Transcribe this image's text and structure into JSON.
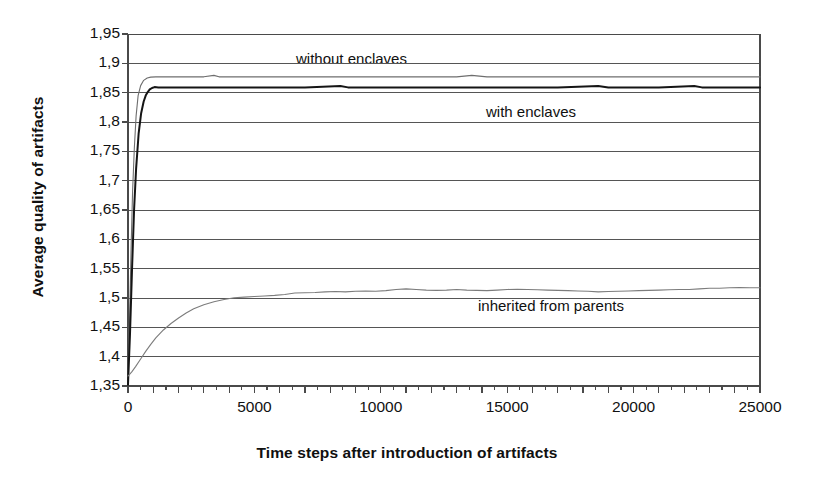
{
  "chart_data": {
    "type": "line",
    "title": "",
    "xlabel": "Time steps after introduction of artifacts",
    "ylabel": "Average quality of artifacts",
    "xlim": [
      0,
      25000
    ],
    "ylim": [
      1.35,
      1.95
    ],
    "ytick_step": 0.05,
    "xtick_step": 5000,
    "x_minor_tick_step": 500,
    "grid": "horizontal",
    "decimal_separator": ",",
    "legend_position": "inline-annotations",
    "xticks": [
      "0",
      "5000",
      "10000",
      "15000",
      "20000",
      "25000"
    ],
    "xtick_values": [
      0,
      5000,
      10000,
      15000,
      20000,
      25000
    ],
    "yticks": [
      "1,35",
      "1,4",
      "1,45",
      "1,5",
      "1,55",
      "1,6",
      "1,65",
      "1,7",
      "1,75",
      "1,8",
      "1,85",
      "1,9",
      "1,95"
    ],
    "ytick_values": [
      1.35,
      1.4,
      1.45,
      1.5,
      1.55,
      1.6,
      1.65,
      1.7,
      1.75,
      1.8,
      1.85,
      1.9,
      1.95
    ],
    "series": [
      {
        "name": "without enclaves",
        "color": "#6e6e6e",
        "width": 1.1,
        "plateau": 1.877,
        "start": 1.352,
        "x": [
          0,
          60,
          120,
          180,
          250,
          320,
          400,
          500,
          620,
          760,
          900,
          1100,
          1400,
          2000,
          3000,
          3400,
          3600,
          5000,
          7000,
          9000,
          11000,
          13000,
          13600,
          14200,
          16000,
          18000,
          20000,
          22000,
          24000,
          25000
        ],
        "values": [
          1.352,
          1.46,
          1.58,
          1.68,
          1.755,
          1.81,
          1.845,
          1.862,
          1.871,
          1.875,
          1.8765,
          1.877,
          1.877,
          1.877,
          1.877,
          1.8795,
          1.877,
          1.877,
          1.877,
          1.877,
          1.877,
          1.877,
          1.8795,
          1.877,
          1.877,
          1.877,
          1.877,
          1.877,
          1.877,
          1.877
        ]
      },
      {
        "name": "with enclaves",
        "color": "#151515",
        "width": 2.0,
        "plateau": 1.859,
        "start": 1.352,
        "x": [
          0,
          80,
          160,
          240,
          320,
          420,
          520,
          620,
          700,
          780,
          860,
          950,
          1050,
          1200,
          1500,
          2000,
          3000,
          5000,
          7000,
          8400,
          8700,
          9000,
          11000,
          13000,
          15000,
          17000,
          18600,
          19000,
          21000,
          22400,
          22700,
          23000,
          25000
        ],
        "values": [
          1.352,
          1.44,
          1.55,
          1.65,
          1.72,
          1.78,
          1.815,
          1.835,
          1.845,
          1.851,
          1.8555,
          1.858,
          1.8595,
          1.859,
          1.859,
          1.859,
          1.859,
          1.859,
          1.859,
          1.8615,
          1.859,
          1.859,
          1.859,
          1.859,
          1.859,
          1.859,
          1.8615,
          1.859,
          1.859,
          1.8615,
          1.859,
          1.859,
          1.859
        ]
      },
      {
        "name": "inherited from parents",
        "color": "#7c7c7c",
        "width": 1.1,
        "plateau": 1.518,
        "start": 1.367,
        "x": [
          0,
          150,
          300,
          500,
          700,
          900,
          1100,
          1400,
          1700,
          2000,
          2300,
          2600,
          3000,
          3400,
          3800,
          4200,
          4600,
          5000,
          5400,
          5800,
          6200,
          6600,
          7000,
          7400,
          7800,
          8200,
          8600,
          9000,
          9400,
          9800,
          10200,
          10600,
          11000,
          11400,
          11800,
          12200,
          12600,
          13000,
          13400,
          13800,
          14200,
          14600,
          15000,
          15400,
          15800,
          16200,
          16600,
          17000,
          17400,
          17800,
          18200,
          18600,
          19000,
          19400,
          19800,
          20200,
          20600,
          21000,
          21400,
          21800,
          22200,
          22600,
          23000,
          23400,
          23800,
          24200,
          24600,
          25000
        ],
        "values": [
          1.367,
          1.374,
          1.383,
          1.396,
          1.409,
          1.421,
          1.432,
          1.4455,
          1.4565,
          1.466,
          1.4745,
          1.4815,
          1.4885,
          1.4935,
          1.4975,
          1.5005,
          1.5015,
          1.5025,
          1.5035,
          1.5045,
          1.506,
          1.5085,
          1.509,
          1.5095,
          1.5105,
          1.511,
          1.5105,
          1.5115,
          1.512,
          1.5115,
          1.5125,
          1.5145,
          1.5155,
          1.5145,
          1.5135,
          1.513,
          1.5135,
          1.5145,
          1.5135,
          1.513,
          1.5125,
          1.5135,
          1.5145,
          1.515,
          1.5145,
          1.514,
          1.5135,
          1.513,
          1.5125,
          1.512,
          1.5115,
          1.5105,
          1.511,
          1.5115,
          1.512,
          1.5125,
          1.513,
          1.5135,
          1.514,
          1.5145,
          1.5145,
          1.5155,
          1.5165,
          1.5165,
          1.5175,
          1.518,
          1.5175,
          1.5175
        ]
      }
    ],
    "annotations": [
      {
        "text": "without enclaves",
        "x_px": 296,
        "y_px": 50
      },
      {
        "text": "with enclaves",
        "x_px": 486,
        "y_px": 103
      },
      {
        "text": "inherited from parents",
        "x_px": 478,
        "y_px": 297
      }
    ],
    "colors": {
      "axis": "#4a4a4a",
      "grid": "#555555",
      "background": "#ffffff",
      "text": "#101010"
    }
  }
}
